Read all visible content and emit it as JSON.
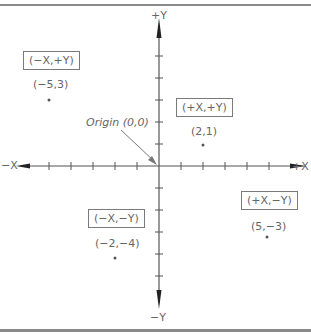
{
  "diagram": {
    "axes": {
      "pos_x": "+X",
      "neg_x": "−X",
      "pos_y": "+Y",
      "neg_y": "−Y"
    },
    "origin_label": "Origin (0,0)",
    "quadrants": [
      {
        "label": "(−X,+Y)",
        "point": "(−5,3)",
        "x": -5,
        "y": 3
      },
      {
        "label": "(+X,+Y)",
        "point": "(2,1)",
        "x": 2,
        "y": 1
      },
      {
        "label": "(−X,−Y)",
        "point": "(−2,−4)",
        "x": -2,
        "y": -4
      },
      {
        "label": "(+X,−Y)",
        "point": "(5,−3)",
        "x": 5,
        "y": -3
      }
    ],
    "tick_range": {
      "x": [
        -6,
        6
      ],
      "y": [
        -6,
        6
      ]
    },
    "colors": {
      "axis": "#444444",
      "text": "#666666",
      "frame": "#8a8a8a"
    }
  }
}
